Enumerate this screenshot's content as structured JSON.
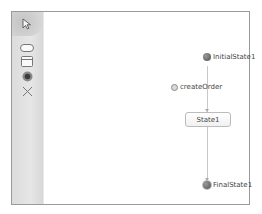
{
  "palette": {
    "tools": [
      {
        "name": "pointer",
        "icon": "pointer-arrow-icon"
      },
      {
        "name": "state",
        "icon": "rounded-rect-icon"
      },
      {
        "name": "composite-state",
        "icon": "compartment-rect-icon"
      },
      {
        "name": "initial-final-state",
        "icon": "filled-circle-icon"
      },
      {
        "name": "delete",
        "icon": "x-cross-icon"
      }
    ]
  },
  "diagram": {
    "initial_state": {
      "label": "InitialState1"
    },
    "transition_event": {
      "label": "createOrder"
    },
    "state": {
      "label": "State1"
    },
    "final_state": {
      "label": "FinalState1"
    },
    "colors": {
      "line": "#c9c9c9",
      "node_fill": "#505050",
      "state_border": "#bcbcbc",
      "palette_bg": "#dcdcdc",
      "frame_border": "#9a9a9a"
    }
  }
}
